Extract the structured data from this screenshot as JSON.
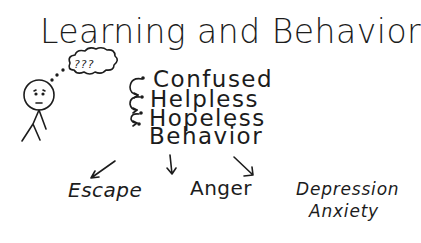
{
  "title": "Learning and Behavior",
  "thought_bubble": {
    "text": "???"
  },
  "sequence": [
    {
      "label": "Confused"
    },
    {
      "label": "Helpless"
    },
    {
      "label": "Hopeless"
    },
    {
      "label": "Behavior"
    }
  ],
  "outcomes": [
    {
      "label": "Escape"
    },
    {
      "label": "Anger"
    },
    {
      "label": "Depression"
    },
    {
      "label": "Anxiety"
    }
  ],
  "colors": {
    "ink": "#1c1c1c",
    "background": "#ffffff"
  }
}
